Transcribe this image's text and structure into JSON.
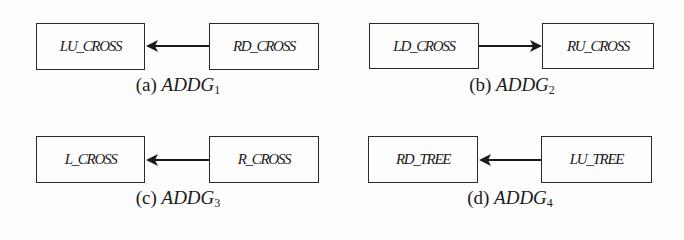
{
  "panels": [
    {
      "id": "a",
      "label": "(a)",
      "graph": "ADDG",
      "index": "1",
      "left_node": "LU_CROSS",
      "right_node": "RD_CROSS",
      "direction": "right-to-left"
    },
    {
      "id": "b",
      "label": "(b)",
      "graph": "ADDG",
      "index": "2",
      "left_node": "LD_CROSS",
      "right_node": "RU_CROSS",
      "direction": "left-to-right"
    },
    {
      "id": "c",
      "label": "(c)",
      "graph": "ADDG",
      "index": "3",
      "left_node": "L_CROSS",
      "right_node": "R_CROSS",
      "direction": "right-to-left"
    },
    {
      "id": "d",
      "label": "(d)",
      "graph": "ADDG",
      "index": "4",
      "left_node": "RD_TREE",
      "right_node": "LU_TREE",
      "direction": "right-to-left"
    }
  ]
}
